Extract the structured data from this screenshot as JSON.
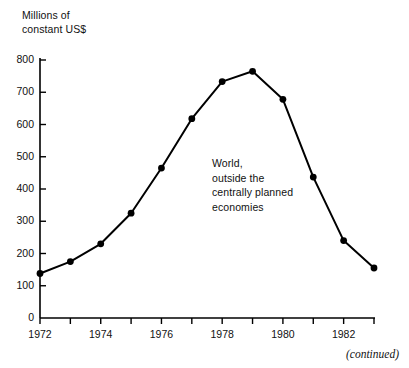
{
  "chart_data": {
    "type": "line",
    "title": "",
    "ylabel": "Millions of\nconstant US$",
    "xlabel": "",
    "annotation": "World,\noutside the\ncentrally planned\neconomies",
    "footer": "(continued)",
    "grid": false,
    "legend_position": "none",
    "marker": "filled-circle",
    "line_color": "#000000",
    "marker_color": "#000000",
    "background_color": "#ffffff",
    "ylim": [
      0,
      800
    ],
    "xlim": [
      1972,
      1983
    ],
    "ytick_labels": [
      "800",
      "700",
      "600",
      "500",
      "400",
      "300",
      "200",
      "100",
      "0"
    ],
    "ytick_values": [
      800,
      700,
      600,
      500,
      400,
      300,
      200,
      100,
      0
    ],
    "xtick_values": [
      1972,
      1973,
      1974,
      1975,
      1976,
      1977,
      1978,
      1979,
      1980,
      1981,
      1982,
      1983
    ],
    "xtick_labels": [
      "1972",
      "",
      "1974",
      "",
      "1976",
      "",
      "1978",
      "",
      "1980",
      "",
      "1982",
      ""
    ],
    "x": [
      1972,
      1973,
      1974,
      1975,
      1976,
      1977,
      1978,
      1979,
      1980,
      1981,
      1982,
      1983
    ],
    "values": [
      138,
      175,
      230,
      325,
      465,
      618,
      733,
      765,
      678,
      437,
      240,
      155
    ],
    "series": [
      {
        "name": "World, outside the centrally planned economies",
        "values": [
          138,
          175,
          230,
          325,
          465,
          618,
          733,
          765,
          678,
          437,
          240,
          155
        ]
      }
    ]
  }
}
